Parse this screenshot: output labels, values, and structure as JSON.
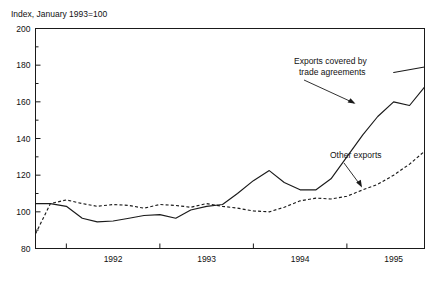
{
  "figure": {
    "axis_title": "Index, January 1993=100"
  },
  "annotations": [
    {
      "name": "exports-covered-label",
      "line1": "Exports covered by",
      "line2": "trade agreements"
    },
    {
      "name": "other-exports-label",
      "line1": "Other exports",
      "line2": ""
    }
  ],
  "chart_data": {
    "type": "line",
    "title": "Index, January 1993=100",
    "xlabel": "",
    "ylabel": "Index, January 1993=100",
    "ylim": [
      80,
      200
    ],
    "xlim": [
      1991.67,
      1995.83
    ],
    "ytick_labels": [
      "80",
      "100",
      "120",
      "140",
      "160",
      "180",
      "200"
    ],
    "yticks": [
      80,
      100,
      120,
      140,
      160,
      180,
      200
    ],
    "yticks_minor": [
      90,
      110,
      130,
      150,
      170,
      190
    ],
    "xtick_labels": [
      "1992",
      "1993",
      "1994",
      "1995"
    ],
    "xticks_boundaries": [
      1992,
      1993,
      1994,
      1995
    ],
    "grid": false,
    "legend": "annotations",
    "series": [
      {
        "name": "Exports covered by trade agreements",
        "style": "solid",
        "x": [
          1991.67,
          1991.83,
          1992.0,
          1992.17,
          1992.33,
          1992.5,
          1992.67,
          1992.83,
          1993.0,
          1993.17,
          1993.33,
          1993.5,
          1993.67,
          1993.83,
          1994.0,
          1994.17,
          1994.33,
          1994.5,
          1994.67,
          1994.83,
          1995.0,
          1995.17,
          1995.33,
          1995.5,
          1995.67,
          1995.83
        ],
        "values": [
          104.5,
          104.5,
          103.0,
          96.5,
          94.5,
          95.0,
          96.5,
          98.0,
          98.5,
          96.5,
          101.0,
          103.0,
          104.0,
          110.0,
          117.0,
          122.5,
          116.0,
          112.0,
          112.0,
          118.0,
          130.0,
          142.0,
          152.0,
          160.0,
          158.0,
          168.0
        ]
      },
      {
        "name": "Exports covered by trade agreements (tail)",
        "style": "solid",
        "x": [
          1995.5,
          1995.83
        ],
        "values": [
          176.0,
          179.0
        ]
      },
      {
        "name": "Other exports",
        "style": "dashed",
        "x": [
          1991.67,
          1991.83,
          1992.0,
          1992.17,
          1992.33,
          1992.5,
          1992.67,
          1992.83,
          1993.0,
          1993.17,
          1993.33,
          1993.5,
          1993.67,
          1993.83,
          1994.0,
          1994.17,
          1994.33,
          1994.5,
          1994.67,
          1994.83,
          1995.0,
          1995.17,
          1995.33,
          1995.5,
          1995.67,
          1995.83
        ],
        "values": [
          88.0,
          104.5,
          106.5,
          104.5,
          103.0,
          104.0,
          103.5,
          102.0,
          104.0,
          103.5,
          102.5,
          104.5,
          103.0,
          102.0,
          100.5,
          100.0,
          102.5,
          106.0,
          107.5,
          107.0,
          108.5,
          112.0,
          115.0,
          120.0,
          126.0,
          133.0
        ]
      }
    ],
    "annotations": [
      {
        "text": "Exports covered by trade agreements",
        "target_x": 1994.72,
        "target_y": 160.0
      },
      {
        "text": "Other exports",
        "target_x": 1995.02,
        "target_y": 113.0
      }
    ]
  }
}
